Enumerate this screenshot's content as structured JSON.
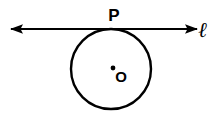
{
  "figure": {
    "background_color": "#ffffff",
    "stroke_color": "#000000"
  },
  "labels": {
    "tangent_point": "P",
    "center_point": "O",
    "line": "ℓ"
  },
  "diagram_data": {
    "type": "geometry",
    "shapes": [
      {
        "kind": "circle",
        "name": "circle-o",
        "cx": 111,
        "cy": 69,
        "r": 40,
        "stroke_width": 2.4,
        "fill": "none"
      },
      {
        "kind": "point",
        "name": "center-dot",
        "x": 113,
        "y": 68,
        "r": 2.4
      },
      {
        "kind": "line",
        "name": "tangent-line",
        "x1": 11,
        "y1": 29,
        "x2": 197,
        "y2": 29,
        "stroke_width": 2.2,
        "arrow_start": true,
        "arrow_end": true
      }
    ],
    "label_positions": [
      {
        "name": "label-p",
        "text": "P",
        "x": 114,
        "y": 21,
        "anchor": "middle"
      },
      {
        "name": "label-o",
        "text": "O",
        "x": 121,
        "y": 82,
        "anchor": "middle"
      },
      {
        "name": "label-l",
        "text": "ℓ",
        "x": 203,
        "y": 37,
        "anchor": "middle"
      }
    ]
  }
}
